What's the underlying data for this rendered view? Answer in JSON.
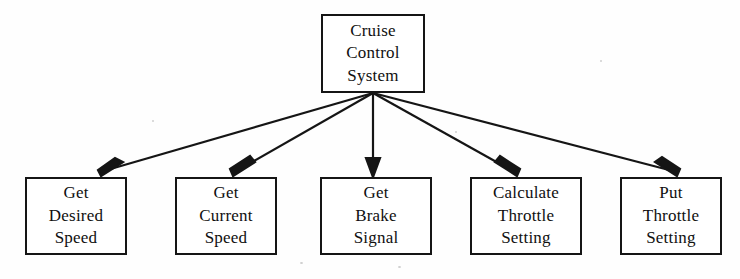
{
  "diagram": {
    "type": "structure-chart",
    "background_color": "#fefefe",
    "line_color": "#151515",
    "text_color": "#101010",
    "root": {
      "id": "cruise-control-system",
      "lines": [
        "Cruise",
        "Control",
        "System"
      ],
      "x": 321,
      "y": 14,
      "width": 104,
      "height": 79
    },
    "fan_origin": {
      "x": 373,
      "y": 93
    },
    "children": [
      {
        "id": "get-desired-speed",
        "lines": [
          "Get",
          "Desired",
          "Speed"
        ],
        "x": 25,
        "y": 177,
        "width": 102,
        "height": 78,
        "arrow_tip": {
          "x": 103,
          "y": 175
        }
      },
      {
        "id": "get-current-speed",
        "lines": [
          "Get",
          "Current",
          "Speed"
        ],
        "x": 175,
        "y": 177,
        "width": 102,
        "height": 78,
        "arrow_tip": {
          "x": 235,
          "y": 175
        }
      },
      {
        "id": "get-brake-signal",
        "lines": [
          "Get",
          "Brake",
          "Signal"
        ],
        "x": 320,
        "y": 177,
        "width": 112,
        "height": 78,
        "arrow_tip": {
          "x": 373,
          "y": 175
        }
      },
      {
        "id": "calculate-throttle-setting",
        "lines": [
          "Calculate",
          "Throttle",
          "Setting"
        ],
        "x": 470,
        "y": 177,
        "width": 112,
        "height": 78,
        "arrow_tip": {
          "x": 515,
          "y": 175
        }
      },
      {
        "id": "put-throttle-setting",
        "lines": [
          "Put",
          "Throttle",
          "Setting"
        ],
        "x": 620,
        "y": 177,
        "width": 102,
        "height": 78,
        "arrow_tip": {
          "x": 675,
          "y": 175
        }
      }
    ]
  }
}
